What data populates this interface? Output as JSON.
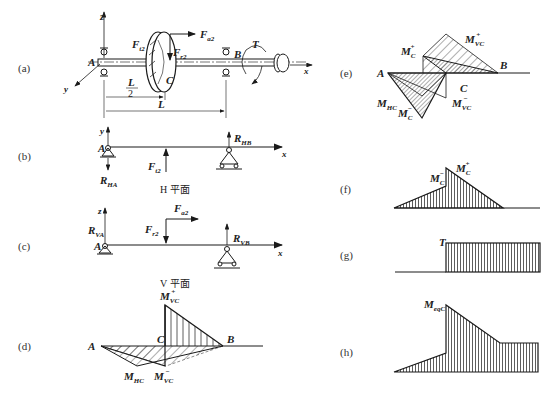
{
  "panels": {
    "a": {
      "label": "(a)"
    },
    "b": {
      "label": "(b)",
      "caption": "H 平面"
    },
    "c": {
      "label": "(c)",
      "caption": "V 平面"
    },
    "d": {
      "label": "(d)"
    },
    "e": {
      "label": "(e)"
    },
    "f": {
      "label": "(f)"
    },
    "g": {
      "label": "(g)"
    },
    "h": {
      "label": "(h)"
    }
  },
  "labels": {
    "A": "A",
    "B": "B",
    "C": "C",
    "x": "x",
    "y": "y",
    "z": "z",
    "T": "T",
    "L": "L",
    "L_half_num": "L",
    "L_half_den": "2",
    "F": "F",
    "sub_t2": "t2",
    "sub_r2": "r2",
    "sub_a2": "a2",
    "R": "R",
    "sub_HA": "HA",
    "sub_HB": "HB",
    "sub_VA": "VA",
    "sub_VB": "VB",
    "M": "M",
    "sub_VC": "VC",
    "sub_HC": "HC",
    "sub_C": "C",
    "sub_eqC": "eqC",
    "sup_plus": "+",
    "sup_minus": "−"
  },
  "colors": {
    "line": "#1a1a1a",
    "hatch": "#333333",
    "background": "#ffffff"
  }
}
